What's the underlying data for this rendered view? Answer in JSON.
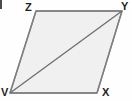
{
  "figure": {
    "kind": "parallelogram-with-diagonal",
    "canvas": {
      "width": 132,
      "height": 101,
      "background": "#fefefe"
    },
    "fill_color": "#f0f0f0",
    "stroke_color": "#808080",
    "diagonal_color": "#6e6e6e",
    "label_color": "#231f20",
    "vertices": [
      {
        "name": "V",
        "label": "V",
        "x": 10,
        "y": 93,
        "label_x": 1,
        "label_y": 87
      },
      {
        "name": "X",
        "label": "X",
        "x": 97,
        "y": 93,
        "label_x": 102,
        "label_y": 87
      },
      {
        "name": "Y",
        "label": "Y",
        "x": 122,
        "y": 11,
        "label_x": 121,
        "label_y": 1
      },
      {
        "name": "Z",
        "label": "Z",
        "x": 36,
        "y": 11,
        "label_x": 25,
        "label_y": 2
      }
    ],
    "edges": [
      {
        "name": "edge-zy",
        "from": "Z",
        "to": "Y"
      },
      {
        "name": "edge-yx",
        "from": "Y",
        "to": "X"
      },
      {
        "name": "edge-xv",
        "from": "X",
        "to": "V"
      },
      {
        "name": "edge-vz",
        "from": "V",
        "to": "Z"
      }
    ],
    "diagonal": {
      "name": "diagonal-vy",
      "from": "V",
      "to": "Y"
    },
    "polygon_points": "36,11 122,11 97,93 10,93",
    "artifact": {
      "name": "corner-mark",
      "x": 0,
      "y": 0,
      "width": 2,
      "height": 9,
      "color": "#4a4a4a"
    }
  }
}
